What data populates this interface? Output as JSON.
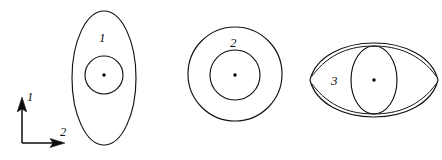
{
  "figure": {
    "background_color": "#ffffff",
    "line_color": "#111111",
    "axes_indicator": {
      "name": "coordinate-axes",
      "vertical_axis_label": "1",
      "horizontal_axis_label": "2",
      "origin": {
        "x": 22,
        "y": 143
      },
      "vertical_tip": {
        "x": 22,
        "y": 99
      },
      "horizontal_tip": {
        "x": 62,
        "y": 143
      }
    },
    "shapes": [
      {
        "id": "shape-1",
        "label": "1",
        "description": "tall vertical ellipse with inner circle and center point",
        "outer": {
          "type": "ellipse",
          "cx": 104,
          "cy": 78,
          "rx": 32,
          "ry": 67
        },
        "inner": {
          "type": "circle",
          "cx": 104,
          "cy": 75,
          "r": 19
        },
        "center_point": {
          "cx": 104,
          "cy": 75,
          "r": 1.6
        },
        "label_position": {
          "x": 99,
          "y": 42
        }
      },
      {
        "id": "shape-2",
        "label": "2",
        "description": "two concentric circles with center point",
        "outer": {
          "type": "circle",
          "cx": 235,
          "cy": 74,
          "r": 47
        },
        "inner": {
          "type": "circle",
          "cx": 235,
          "cy": 75,
          "r": 25
        },
        "center_point": {
          "cx": 235,
          "cy": 75,
          "r": 1.6
        },
        "label_position": {
          "x": 230,
          "y": 47
        }
      },
      {
        "id": "shape-3",
        "label": "3",
        "description": "wide horizontal lens with overlapping vertical ellipse and center point",
        "outer": {
          "type": "ellipse",
          "cx": 374,
          "cy": 80,
          "rx": 64,
          "ry": 26
        },
        "inner": {
          "type": "ellipse",
          "cx": 374,
          "cy": 80,
          "rx": 23,
          "ry": 34
        },
        "center_point": {
          "cx": 374,
          "cy": 80,
          "r": 1.6
        },
        "label_position": {
          "x": 331,
          "y": 85
        }
      }
    ]
  }
}
